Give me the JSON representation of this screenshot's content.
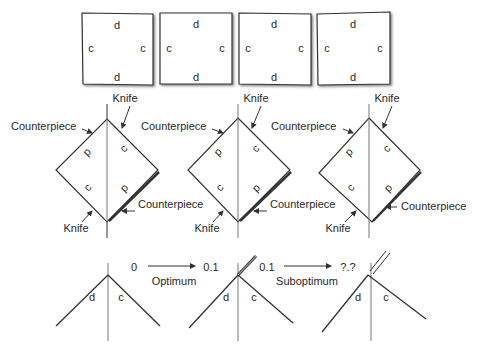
{
  "figure": {
    "top_row": {
      "squares": [
        {
          "top": "d",
          "bottom": "d",
          "left": "c",
          "right": "c"
        },
        {
          "top": "d",
          "bottom": "d",
          "left": "c",
          "right": "c"
        },
        {
          "top": "d",
          "bottom": "d",
          "left": "c",
          "right": "c"
        },
        {
          "top": "d",
          "bottom": "d",
          "left": "c",
          "right": "c"
        }
      ]
    },
    "middle_row": {
      "diamonds": [
        {
          "knife_top": "Knife",
          "counterpiece_top": "Counterpiece",
          "counterpiece_bottom": "Counterpiece",
          "knife_bottom": "Knife",
          "upper_left": "d",
          "upper_right": "c",
          "lower_left": "c",
          "lower_right": "d"
        },
        {
          "knife_top": "Knife",
          "counterpiece_top": "Counterpiece",
          "counterpiece_bottom": "Counterpiece",
          "knife_bottom": "Knife",
          "upper_left": "d",
          "upper_right": "c",
          "lower_left": "c",
          "lower_right": "d"
        },
        {
          "knife_top": "Knife",
          "counterpiece_top": "Counterpiece",
          "counterpiece_bottom": "Counterpiece",
          "knife_bottom": "Knife",
          "upper_left": "d",
          "upper_right": "c",
          "lower_left": "c",
          "lower_right": "d"
        }
      ]
    },
    "bottom_row": {
      "angles": [
        {
          "left": "d",
          "right": "c"
        },
        {
          "left": "d",
          "right": "c"
        },
        {
          "left": "d",
          "right": "c"
        }
      ],
      "transitions": [
        {
          "from": "0",
          "to": "0.1",
          "label": "Optimum"
        },
        {
          "from": "0.1",
          "to": "?.?",
          "label": "Suboptimum"
        }
      ]
    }
  }
}
